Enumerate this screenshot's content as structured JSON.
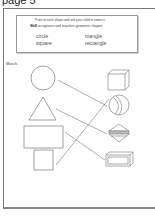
{
  "page": {
    "header": "page 5",
    "instructions": {
      "line1": "Point to each shape and ask your child to name it.",
      "skill_label": "Skill",
      "skill_text": "recognizes and matches geometric shapes"
    },
    "word_bank": [
      "circle",
      "triangle",
      "square",
      "rectangle"
    ],
    "match_label": "Match.",
    "left_shapes": [
      "circle",
      "triangle",
      "rectangle",
      "square"
    ],
    "right_objects": [
      "cube",
      "ball",
      "pyramid",
      "box"
    ],
    "connections": [
      {
        "from": "circle",
        "to": "ball"
      },
      {
        "from": "triangle",
        "to": "pyramid"
      },
      {
        "from": "rectangle",
        "to": "box"
      },
      {
        "from": "square",
        "to": "cube"
      }
    ]
  }
}
